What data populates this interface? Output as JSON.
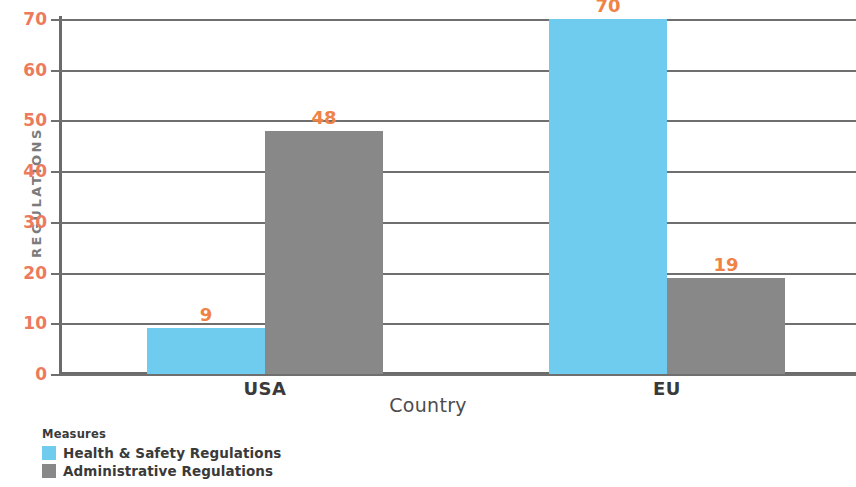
{
  "chart_data": {
    "type": "bar",
    "title": "",
    "subtitle": "",
    "xlabel": "Country",
    "ylabel": "REGULATIONS",
    "categories": [
      "USA",
      "EU"
    ],
    "series": [
      {
        "name": "Health & Safety Regulations",
        "color": "#6fccef",
        "values": [
          9,
          70
        ]
      },
      {
        "name": "Administrative Regulations",
        "color": "#888888",
        "values": [
          48,
          19
        ]
      }
    ],
    "value_labels": [
      "9",
      "48",
      "70",
      "19"
    ],
    "ylim": [
      0,
      70
    ],
    "ytick_values": [
      0,
      10,
      20,
      30,
      40,
      50,
      60,
      70
    ],
    "ytick_labels": [
      "0",
      "10",
      "20",
      "30",
      "40",
      "50",
      "60",
      "70"
    ],
    "grid": true,
    "grid_axis": "y",
    "legend_position": "bottom-left",
    "legend_title": "Measures",
    "bar_mode": "grouped",
    "bar_gap": 0,
    "colors": {
      "series_1": "#6fccef",
      "series_2": "#888888",
      "tick_label": "#ec7a5c",
      "value_label": "#ef8245",
      "axis_line": "#6b6b6b",
      "gridline": "#6f6f6f",
      "axis_title": "#4d4d4d",
      "y_axis_title": "#7b7b7b",
      "category_label": "#3a3a3a",
      "legend_text": "#3a3a3a",
      "background": "#ffffff"
    }
  },
  "axes": {
    "y_title": "REGULATIONS",
    "x_title": "Country",
    "ticks": [
      {
        "label": "70",
        "value": 70
      },
      {
        "label": "60",
        "value": 60
      },
      {
        "label": "50",
        "value": 50
      },
      {
        "label": "40",
        "value": 40
      },
      {
        "label": "30",
        "value": 30
      },
      {
        "label": "20",
        "value": 20
      },
      {
        "label": "10",
        "value": 10
      },
      {
        "label": "0",
        "value": 0
      }
    ]
  },
  "groups": [
    {
      "name": "USA",
      "bars": [
        {
          "series": "Health & Safety Regulations",
          "value": 9,
          "label": "9"
        },
        {
          "series": "Administrative Regulations",
          "value": 48,
          "label": "48"
        }
      ]
    },
    {
      "name": "EU",
      "bars": [
        {
          "series": "Health & Safety Regulations",
          "value": 70,
          "label": "70"
        },
        {
          "series": "Administrative Regulations",
          "value": 19,
          "label": "19"
        }
      ]
    }
  ],
  "legend": {
    "title": "Measures",
    "items": [
      {
        "label": "Health & Safety Regulations",
        "color": "#6fccef"
      },
      {
        "label": "Administrative Regulations",
        "color": "#888888"
      }
    ]
  }
}
